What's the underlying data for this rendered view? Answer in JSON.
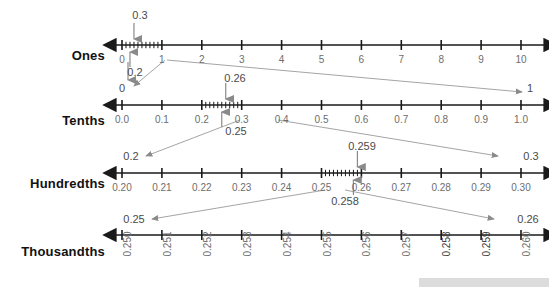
{
  "figure": {
    "background": "#ffffff",
    "line_color": "#1a1a1a",
    "tick_label_color": "#6d6d6d",
    "annotation_color": "#6d6d6d",
    "row_label_color": "#111111"
  },
  "rows": [
    {
      "id": "ones",
      "label": "Ones",
      "axis_y": 45,
      "x_start": 115,
      "x_end": 545,
      "tick_x_start": 122,
      "tick_x_end": 521,
      "ticks": [
        "0",
        "1",
        "2",
        "3",
        "4",
        "5",
        "6",
        "7",
        "8",
        "9",
        "10"
      ],
      "label_y": 54,
      "subdivision": {
        "from": "0",
        "to": "1",
        "count": 10
      }
    },
    {
      "id": "tenths",
      "label": "Tenths",
      "axis_y": 105,
      "x_start": 115,
      "x_end": 545,
      "tick_x_start": 122,
      "tick_x_end": 521,
      "ticks": [
        "0.0",
        "0.1",
        "0.2",
        "0.3",
        "0.4",
        "0.5",
        "0.6",
        "0.7",
        "0.8",
        "0.9",
        "1.0"
      ],
      "label_y": 114,
      "subdivision": {
        "from": "0.2",
        "to": "0.3",
        "count": 10
      }
    },
    {
      "id": "hundredths",
      "label": "Hundredths",
      "axis_y": 173,
      "x_start": 115,
      "x_end": 545,
      "tick_x_start": 122,
      "tick_x_end": 521,
      "ticks": [
        "0.20",
        "0.21",
        "0.22",
        "0.23",
        "0.24",
        "0.25",
        "0.26",
        "0.27",
        "0.28",
        "0.29",
        "0.30"
      ],
      "label_y": 182,
      "subdivision": {
        "from": "0.25",
        "to": "0.26",
        "count": 10
      }
    },
    {
      "id": "thousandths",
      "label": "Thousandths",
      "axis_y": 235,
      "x_start": 115,
      "x_end": 545,
      "tick_x_start": 122,
      "tick_x_end": 521,
      "ticks": [
        "0.250",
        "0.251",
        "0.252",
        "0.253",
        "0.254",
        "0.255",
        "0.256",
        "0.257",
        "0.258",
        "0.259",
        "0.260"
      ],
      "label_y": 244,
      "subdivision": null
    }
  ],
  "annotations": {
    "ones_top_value": "0.3",
    "ones_down_to_tenths_value": "0.2",
    "tenths_left_endpoint": "0",
    "tenths_right_endpoint": "1",
    "tenths_top_value": "0.26",
    "tenths_bottom_value": "0.25",
    "hundredths_left_endpoint": "0.2",
    "hundredths_right_endpoint": "0.3",
    "hundredths_top_value": "0.259",
    "hundredths_bottom_value": "0.258",
    "thousandths_left_endpoint": "0.25",
    "thousandths_right_endpoint": "0.26"
  },
  "chart_data": {
    "type": "line",
    "xlabel": "",
    "ylabel": "",
    "grid": false,
    "legend": "none",
    "series": [
      {
        "name": "Ones",
        "categories": [
          "0",
          "1",
          "2",
          "3",
          "4",
          "5",
          "6",
          "7",
          "8",
          "9",
          "10"
        ],
        "values": [
          0,
          1,
          2,
          3,
          4,
          5,
          6,
          7,
          8,
          9,
          10
        ],
        "xlim": [
          0,
          10
        ],
        "minor_subdivision_between": [
          "0",
          "1"
        ],
        "minor_subdivision_count": 10,
        "markers": [
          {
            "label": "0.3",
            "value": 0.3,
            "direction": "down"
          },
          {
            "label": "0.2",
            "value": 0.2,
            "direction": "up"
          }
        ]
      },
      {
        "name": "Tenths",
        "categories": [
          "0.0",
          "0.1",
          "0.2",
          "0.3",
          "0.4",
          "0.5",
          "0.6",
          "0.7",
          "0.8",
          "0.9",
          "1.0"
        ],
        "values": [
          0.0,
          0.1,
          0.2,
          0.3,
          0.4,
          0.5,
          0.6,
          0.7,
          0.8,
          0.9,
          1.0
        ],
        "xlim": [
          0.0,
          1.0
        ],
        "minor_subdivision_between": [
          "0.2",
          "0.3"
        ],
        "minor_subdivision_count": 10,
        "endpoints": {
          "left": "0",
          "right": "1"
        },
        "markers": [
          {
            "label": "0.26",
            "value": 0.26,
            "direction": "down"
          },
          {
            "label": "0.25",
            "value": 0.25,
            "direction": "up"
          }
        ]
      },
      {
        "name": "Hundredths",
        "categories": [
          "0.20",
          "0.21",
          "0.22",
          "0.23",
          "0.24",
          "0.25",
          "0.26",
          "0.27",
          "0.28",
          "0.29",
          "0.30"
        ],
        "values": [
          0.2,
          0.21,
          0.22,
          0.23,
          0.24,
          0.25,
          0.26,
          0.27,
          0.28,
          0.29,
          0.3
        ],
        "xlim": [
          0.2,
          0.3
        ],
        "minor_subdivision_between": [
          "0.25",
          "0.26"
        ],
        "minor_subdivision_count": 10,
        "endpoints": {
          "left": "0.2",
          "right": "0.3"
        },
        "markers": [
          {
            "label": "0.259",
            "value": 0.259,
            "direction": "down"
          },
          {
            "label": "0.258",
            "value": 0.258,
            "direction": "up"
          }
        ]
      },
      {
        "name": "Thousandths",
        "categories": [
          "0.250",
          "0.251",
          "0.252",
          "0.253",
          "0.254",
          "0.255",
          "0.256",
          "0.257",
          "0.258",
          "0.259",
          "0.260"
        ],
        "values": [
          0.25,
          0.251,
          0.252,
          0.253,
          0.254,
          0.255,
          0.256,
          0.257,
          0.258,
          0.259,
          0.26
        ],
        "xlim": [
          0.25,
          0.26
        ],
        "minor_subdivision_between": null,
        "minor_subdivision_count": 0,
        "endpoints": {
          "left": "0.25",
          "right": "0.26"
        },
        "markers": []
      }
    ],
    "zoom_links": [
      {
        "from": "Ones 0–1",
        "to": "Tenths 0–1"
      },
      {
        "from": "Tenths 0.2–0.3",
        "to": "Hundredths 0.2–0.3"
      },
      {
        "from": "Hundredths 0.25–0.26",
        "to": "Thousandths 0.25–0.26"
      }
    ]
  }
}
